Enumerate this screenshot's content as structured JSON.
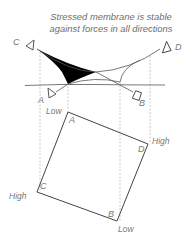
{
  "title": {
    "line1": "Stressed membrane is stable",
    "line2": "against forces in all directions"
  },
  "elevation": {
    "corner_labels": {
      "A": "A",
      "B": "B",
      "C": "C",
      "D": "D"
    },
    "membrane_fill_color": "#000000"
  },
  "plan": {
    "corner_labels": {
      "A": "A",
      "B": "B",
      "C": "C",
      "D": "D"
    },
    "height_labels": {
      "A": "Low",
      "B": "Low",
      "C": "High",
      "D": "High"
    }
  }
}
